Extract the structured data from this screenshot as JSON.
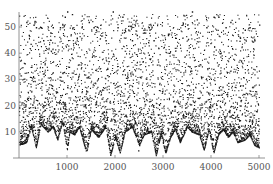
{
  "chart_data": {
    "type": "scatter",
    "title": "",
    "xlabel": "",
    "ylabel": "",
    "xlim": [
      0,
      5100
    ],
    "ylim": [
      0,
      56
    ],
    "grid": false,
    "legend": null,
    "x_ticks": [
      1000,
      2000,
      3000,
      4000,
      5000
    ],
    "x_tick_labels": [
      "1000",
      "2000",
      "3000",
      "4000",
      "5000"
    ],
    "y_ticks": [
      10,
      20,
      30,
      40,
      50
    ],
    "y_tick_labels": [
      "10",
      "20",
      "30",
      "40",
      "50"
    ],
    "marker_color": "#1a1a1a",
    "axis_color": "#777777",
    "lower_envelope": [
      [
        0,
        5
      ],
      [
        150,
        6
      ],
      [
        250,
        12
      ],
      [
        350,
        4
      ],
      [
        450,
        13
      ],
      [
        600,
        10
      ],
      [
        700,
        12
      ],
      [
        800,
        7
      ],
      [
        900,
        14
      ],
      [
        1000,
        3
      ],
      [
        1050,
        10
      ],
      [
        1150,
        9
      ],
      [
        1250,
        12
      ],
      [
        1400,
        2
      ],
      [
        1500,
        11
      ],
      [
        1650,
        8
      ],
      [
        1800,
        12
      ],
      [
        1900,
        1
      ],
      [
        2000,
        8
      ],
      [
        2100,
        2
      ],
      [
        2200,
        10
      ],
      [
        2350,
        12
      ],
      [
        2500,
        5
      ],
      [
        2600,
        9
      ],
      [
        2750,
        10
      ],
      [
        2850,
        1
      ],
      [
        2950,
        9
      ],
      [
        3050,
        2
      ],
      [
        3150,
        8
      ],
      [
        3250,
        11
      ],
      [
        3350,
        6
      ],
      [
        3500,
        12
      ],
      [
        3600,
        10
      ],
      [
        3750,
        9
      ],
      [
        3850,
        3
      ],
      [
        3950,
        11
      ],
      [
        4050,
        2
      ],
      [
        4150,
        9
      ],
      [
        4250,
        11
      ],
      [
        4350,
        8
      ],
      [
        4450,
        10
      ],
      [
        4550,
        6
      ],
      [
        4700,
        7
      ],
      [
        4800,
        9
      ],
      [
        4900,
        5
      ],
      [
        5000,
        4
      ]
    ],
    "sample_points": [
      [
        150,
        52
      ],
      [
        200,
        47
      ],
      [
        300,
        51
      ],
      [
        350,
        50
      ],
      [
        450,
        50
      ],
      [
        500,
        45
      ],
      [
        650,
        48
      ],
      [
        700,
        50
      ],
      [
        850,
        50
      ],
      [
        900,
        51
      ],
      [
        950,
        54
      ],
      [
        1000,
        56
      ],
      [
        1100,
        55
      ],
      [
        1200,
        46
      ],
      [
        1300,
        50
      ],
      [
        1450,
        52
      ],
      [
        1550,
        50
      ],
      [
        1600,
        49
      ],
      [
        1800,
        45
      ],
      [
        1950,
        56
      ],
      [
        2050,
        50
      ],
      [
        2150,
        54
      ],
      [
        2200,
        49
      ],
      [
        2350,
        45
      ],
      [
        2450,
        47
      ],
      [
        2600,
        48
      ],
      [
        2700,
        50
      ],
      [
        2800,
        45
      ],
      [
        2900,
        42
      ],
      [
        3100,
        47
      ],
      [
        3250,
        46
      ],
      [
        3400,
        51
      ],
      [
        3500,
        51
      ],
      [
        3600,
        56
      ],
      [
        3700,
        53
      ],
      [
        3900,
        50
      ],
      [
        4050,
        54
      ],
      [
        4150,
        54
      ],
      [
        4300,
        50
      ],
      [
        4400,
        52
      ],
      [
        4600,
        46
      ],
      [
        4700,
        49
      ],
      [
        4800,
        50
      ],
      [
        4900,
        45
      ],
      [
        5000,
        51
      ],
      [
        2480,
        3
      ],
      [
        2500,
        5
      ],
      [
        2520,
        7
      ]
    ],
    "generated_point_count": 5000
  }
}
